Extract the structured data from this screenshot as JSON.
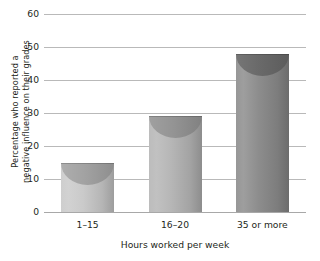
{
  "chart_data": {
    "type": "bar",
    "title": "",
    "subtitle": "",
    "categories": [
      "1–15",
      "16–20",
      "35 or more"
    ],
    "values": [
      15,
      29,
      48
    ],
    "series": [
      {
        "name": "Percentage who reported a negative influence on their grades",
        "values": [
          15,
          29,
          48
        ]
      }
    ],
    "xlabel": "Hours worked per week",
    "ylabel_line1": "Percentage who reported a",
    "ylabel_line2": "negative influence on their grades",
    "ylabel": "Percentage who reported a negative influence on their grades",
    "ylim": [
      0,
      60
    ],
    "ytick_values": [
      0,
      10,
      20,
      30,
      40,
      50,
      60
    ],
    "ytick_labels": [
      "0",
      "10",
      "20",
      "30",
      "40",
      "50",
      "60"
    ],
    "grid": "horizontal",
    "legend": "none",
    "bar_style": "cylinder",
    "bar_colors": [
      "#c9c9c9",
      "#b5b5b5",
      "#8b8b8b"
    ],
    "bar_cap_colors": [
      "#a9a9a9",
      "#9a9a9a",
      "#6d6d6d"
    ],
    "annotations": []
  }
}
